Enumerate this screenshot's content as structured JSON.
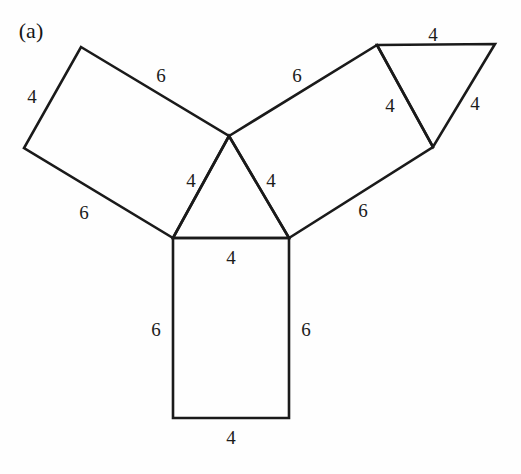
{
  "figure": {
    "panel_label": "(a)",
    "panel_label_pos": {
      "x": 31,
      "y": 31
    },
    "background_color": "#fefefe",
    "line_color": "#1a1a1a",
    "text_color": "#1b1b1b",
    "width": 521,
    "height": 474,
    "vertices": {
      "tri_top": {
        "x": 229,
        "y": 136
      },
      "tri_bottom_left": {
        "x": 173,
        "y": 238
      },
      "tri_bottom_right": {
        "x": 289,
        "y": 238
      },
      "left_rect_top": {
        "x": 81,
        "y": 47
      },
      "left_rect_left": {
        "x": 24,
        "y": 148
      },
      "right_rect_top": {
        "x": 377,
        "y": 45
      },
      "right_rect_right": {
        "x": 433,
        "y": 147
      },
      "upper_tri_apex": {
        "x": 495,
        "y": 44
      },
      "bottom_rect_left": {
        "x": 173,
        "y": 418
      },
      "bottom_rect_right": {
        "x": 289,
        "y": 418
      }
    },
    "polygons": [
      {
        "name": "left-rectangle",
        "points": "81,47 229,136 173,238 24,148"
      },
      {
        "name": "upper-right-rectangle",
        "points": "229,136 377,45 433,147 289,238"
      },
      {
        "name": "bottom-rectangle",
        "points": "173,238 289,238 289,418 173,418"
      },
      {
        "name": "central-triangle",
        "points": "229,136 289,238 173,238"
      },
      {
        "name": "upper-right-triangle",
        "points": "377,45 495,44 433,147"
      }
    ],
    "edge_labels": [
      {
        "name": "left-rect-short-upper",
        "value": "4",
        "x": 32,
        "y": 96
      },
      {
        "name": "left-rect-long-upper",
        "value": "6",
        "x": 161,
        "y": 75
      },
      {
        "name": "left-rect-long-lower",
        "value": "6",
        "x": 84,
        "y": 212
      },
      {
        "name": "upper-right-rect-long-upper",
        "value": "6",
        "x": 297,
        "y": 75
      },
      {
        "name": "upper-right-rect-long-lower",
        "value": "6",
        "x": 363,
        "y": 210
      },
      {
        "name": "upper-triangle-top",
        "value": "4",
        "x": 433,
        "y": 34
      },
      {
        "name": "upper-triangle-left",
        "value": "4",
        "x": 390,
        "y": 105
      },
      {
        "name": "upper-triangle-right",
        "value": "4",
        "x": 475,
        "y": 103
      },
      {
        "name": "central-triangle-left",
        "value": "4",
        "x": 191,
        "y": 180
      },
      {
        "name": "central-triangle-right",
        "value": "4",
        "x": 271,
        "y": 180
      },
      {
        "name": "central-triangle-base",
        "value": "4",
        "x": 231,
        "y": 257
      },
      {
        "name": "bottom-rect-left",
        "value": "6",
        "x": 156,
        "y": 329
      },
      {
        "name": "bottom-rect-right",
        "value": "6",
        "x": 306,
        "y": 329
      },
      {
        "name": "bottom-rect-bottom",
        "value": "4",
        "x": 231,
        "y": 437
      }
    ]
  }
}
